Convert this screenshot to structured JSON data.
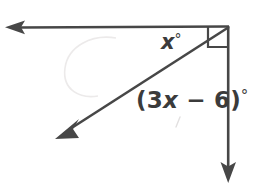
{
  "figure": {
    "background_color": "#ffffff",
    "stroke_color": "#474747",
    "text_color": "#3b3b3b"
  },
  "labels": {
    "angle_x": {
      "text": "x",
      "degree_symbol": "°",
      "full": "x°"
    },
    "angle_expression": {
      "open_paren": "(",
      "coefficient": "3",
      "variable": "x",
      "operator": "−",
      "constant": "6",
      "close_paren": ")",
      "degree_symbol": "°",
      "full": "(3x − 6)°"
    }
  },
  "geometry": {
    "vertex": {
      "x": 229,
      "y": 26
    },
    "rays": [
      {
        "name": "horizontal-ray-left",
        "from": {
          "x": 229,
          "y": 26
        },
        "to": {
          "x": 6,
          "y": 27
        },
        "arrow_at": "to"
      },
      {
        "name": "diagonal-ray-down-left",
        "from": {
          "x": 229,
          "y": 26
        },
        "to": {
          "x": 56,
          "y": 138
        },
        "arrow_at": "to"
      },
      {
        "name": "vertical-ray-down",
        "from": {
          "x": 228,
          "y": 26
        },
        "to": {
          "x": 228,
          "y": 182
        },
        "arrow_at": "to"
      }
    ],
    "right_angle_marker": {
      "name": "right-angle-square",
      "x": 208,
      "y": 26,
      "size": 21,
      "between_rays": [
        "horizontal-ray-left",
        "vertical-ray-down"
      ]
    }
  }
}
